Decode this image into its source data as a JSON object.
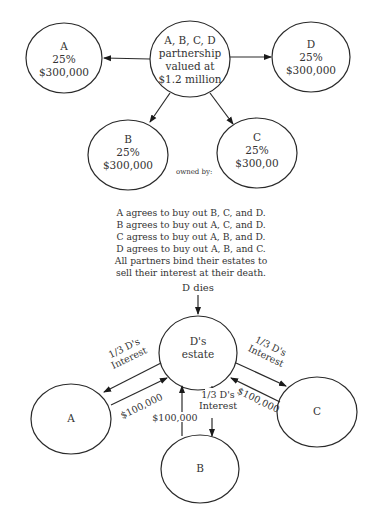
{
  "diagram_top": {
    "center_node": {
      "lines": [
        "A, B, C, D",
        "partnership",
        "valued at",
        "$1.2 million"
      ]
    },
    "partners": [
      {
        "id": "A",
        "lines": [
          "A",
          "25%",
          "$300,000"
        ]
      },
      {
        "id": "D",
        "lines": [
          "D",
          "25%",
          "$300,000"
        ]
      },
      {
        "id": "B",
        "lines": [
          "B",
          "25%",
          "$300,000"
        ]
      },
      {
        "id": "C",
        "lines": [
          "C",
          "25%",
          "$300,00"
        ]
      }
    ],
    "owned_by_label": "owned by:"
  },
  "agreement": {
    "lines": [
      "A agrees to buy out B, C, and D.",
      "B agrees to buy out A, C, and D.",
      "C agress to buy out A, B, and D.",
      "D agrees to buy out A, B, and C.",
      "All partners bind their estates to",
      "sell their interest at their death."
    ]
  },
  "diagram_bottom": {
    "event_label": "D dies",
    "estate_node": {
      "lines": [
        "D's",
        "estate"
      ]
    },
    "nodes": {
      "A": "A",
      "B": "B",
      "C": "C"
    },
    "edge_labels": {
      "interest_to_A": [
        "1/3 D's",
        "Interest"
      ],
      "payment_from_A": "$100,000",
      "interest_to_C": [
        "1/3 D's",
        "Interest"
      ],
      "payment_from_C": "$100,000",
      "interest_to_B": [
        "1/3 D's",
        "Interest"
      ],
      "payment_from_B": "$100,000"
    }
  }
}
